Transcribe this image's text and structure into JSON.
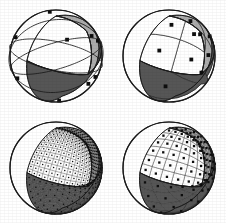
{
  "figure": {
    "background_color": "#ffffff",
    "layout": "2x2-grid",
    "panel_count": 4,
    "colors": {
      "white_region": "#ffffff",
      "light_gray_region": "#ababab",
      "dark_gray_region": "#565656",
      "outline": "#1a1a1a",
      "grid_line": "#2b2b2b",
      "marker": "#0d0d0d",
      "background": "#ffffff"
    },
    "panels": [
      {
        "id": "panel-top-left",
        "name": "coarse-partition-sphere",
        "label": "",
        "divisions": 1,
        "has_center_markers": true,
        "marker_count": 6,
        "marker_shape": "square",
        "has_extra_great_circles": true,
        "regions": [
          "white",
          "light-gray",
          "dark-gray"
        ],
        "cx": 56,
        "cy": 56,
        "r": 46
      },
      {
        "id": "panel-top-right",
        "name": "coarse-subdivided-sphere",
        "label": "",
        "divisions": 2,
        "has_center_markers": true,
        "marker_count": 24,
        "marker_shape": "square",
        "has_extra_great_circles": false,
        "regions": [
          "white",
          "light-gray",
          "dark-gray"
        ],
        "cx": 56,
        "cy": 56,
        "r": 46
      },
      {
        "id": "panel-bottom-left",
        "name": "fine-mesh-sphere",
        "label": "",
        "divisions": 12,
        "has_center_markers": true,
        "marker_count": 432,
        "marker_shape": "dot",
        "has_extra_great_circles": false,
        "regions": [
          "white",
          "light-gray",
          "dark-gray"
        ],
        "cx": 56,
        "cy": 56,
        "r": 46
      },
      {
        "id": "panel-bottom-right",
        "name": "medium-mesh-sphere",
        "label": "",
        "divisions": 6,
        "has_center_markers": true,
        "marker_count": 108,
        "marker_shape": "square",
        "has_extra_great_circles": false,
        "regions": [
          "white",
          "light-gray",
          "dark-gray"
        ],
        "cx": 56,
        "cy": 56,
        "r": 46
      }
    ]
  }
}
